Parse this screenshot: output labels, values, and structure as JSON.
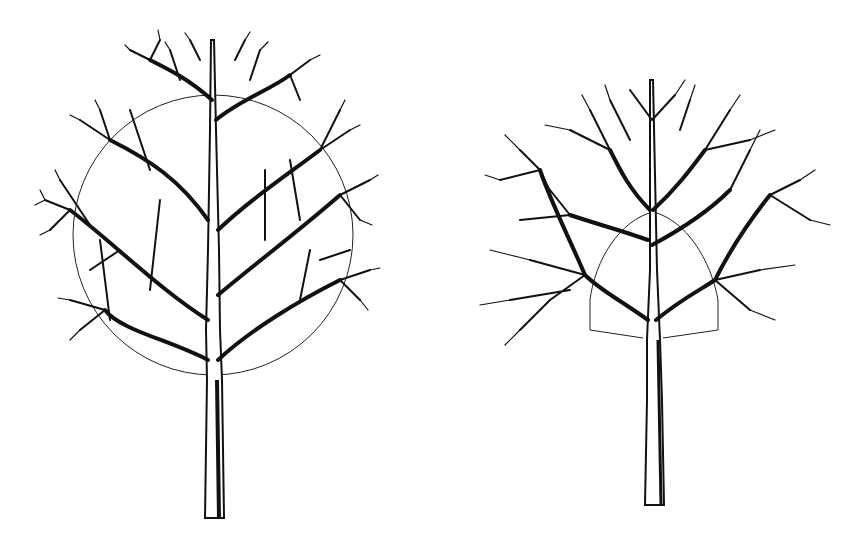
{
  "figures": [
    {
      "id": "tree-left",
      "description": "Bare deciduous tree with a spherical crown and central leader; thin circle outline indicates the round crown shape",
      "crown_guide": "circle",
      "trunk": {
        "x": 213,
        "top_y": 370,
        "bottom_y": 518
      },
      "guide": {
        "cx": 213,
        "cy": 235,
        "r": 140
      }
    },
    {
      "id": "tree-right",
      "description": "Bare deciduous tree with an open, wider crown; thin arched/box outline marks the inner crown frame",
      "crown_guide": "arch-box",
      "trunk": {
        "x": 223,
        "top_y": 338,
        "bottom_y": 505
      },
      "guide": {
        "left": 160,
        "right": 288,
        "base_y": 330,
        "top_y": 215
      }
    }
  ],
  "colors": {
    "ink": "#111111",
    "background": "#ffffff"
  }
}
